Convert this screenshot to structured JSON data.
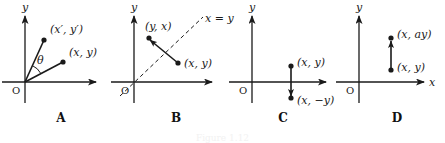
{
  "figure": {
    "width": 445,
    "height": 143,
    "background": "#ffffff",
    "ink_color": "#1a1a1a",
    "caption_cropped": "Figure 1.12"
  },
  "panels": [
    {
      "id": "A",
      "caption": "A",
      "caption_x": 61,
      "caption_y": 112,
      "origin": {
        "x": 25,
        "y": 82
      },
      "origin_label": "O",
      "axes": {
        "y_label": "y",
        "y_label_x": 22,
        "y_label_y": 2,
        "x_label": "",
        "x_axis_left": 2,
        "x_axis_right": 96,
        "y_axis_top": 16,
        "y_axis_bottom": 103
      },
      "points": [
        {
          "label": "(x′, y′)",
          "px": 44,
          "py": 40,
          "label_x": 50,
          "label_y": 24
        },
        {
          "label": "(x, y)",
          "px": 63,
          "py": 62,
          "label_x": 69,
          "label_y": 47
        }
      ],
      "segments": [
        {
          "from": [
            25,
            82
          ],
          "to": [
            44,
            40
          ],
          "style": "solid",
          "arrow": false
        },
        {
          "from": [
            25,
            82
          ],
          "to": [
            63,
            62
          ],
          "style": "solid",
          "arrow": false
        }
      ],
      "angle": {
        "label": "θ",
        "label_x": 37,
        "label_y": 55,
        "radius": 18,
        "start_deg": 28,
        "end_deg": 66
      }
    },
    {
      "id": "B",
      "caption": "B",
      "caption_x": 176,
      "caption_y": 112,
      "origin": {
        "x": 134,
        "y": 82
      },
      "origin_label": "O",
      "axes": {
        "y_label": "y",
        "y_label_x": 131,
        "y_label_y": 2,
        "x_label": "",
        "x_axis_left": 111,
        "x_axis_right": 212,
        "y_axis_top": 16,
        "y_axis_bottom": 103
      },
      "points": [
        {
          "label": "(y, x)",
          "px": 149,
          "py": 38,
          "label_x": 145,
          "label_y": 21
        },
        {
          "label": "(x, y)",
          "px": 178,
          "py": 63,
          "label_x": 184,
          "label_y": 58
        }
      ],
      "segments": [
        {
          "from": [
            178,
            63
          ],
          "to": [
            150,
            40
          ],
          "style": "solid",
          "arrow": true
        }
      ],
      "dashed_line": {
        "from": [
          120,
          96
        ],
        "to": [
          203,
          17
        ],
        "label": "x = y",
        "label_x": 205,
        "label_y": 13
      }
    },
    {
      "id": "C",
      "caption": "C",
      "caption_x": 283,
      "caption_y": 112,
      "origin": {
        "x": 252,
        "y": 82
      },
      "origin_label": "O",
      "axes": {
        "y_label": "y",
        "y_label_x": 249,
        "y_label_y": 2,
        "x_label": "",
        "x_axis_left": 229,
        "x_axis_right": 326,
        "y_axis_top": 16,
        "y_axis_bottom": 103
      },
      "points": [
        {
          "label": "(x, y)",
          "px": 291,
          "py": 66,
          "label_x": 297,
          "label_y": 57
        },
        {
          "label": "(x, −y)",
          "px": 291,
          "py": 98,
          "label_x": 297,
          "label_y": 95
        }
      ],
      "segments": [
        {
          "from": [
            291,
            66
          ],
          "to": [
            291,
            96
          ],
          "style": "solid",
          "arrow": true
        }
      ]
    },
    {
      "id": "D",
      "caption": "D",
      "caption_x": 397,
      "caption_y": 112,
      "origin": {
        "x": 359,
        "y": 82
      },
      "origin_label": "O",
      "axes": {
        "y_label": "y",
        "y_label_x": 356,
        "y_label_y": 2,
        "x_label": "x",
        "x_label_x": 429,
        "x_label_y": 77,
        "x_axis_left": 336,
        "x_axis_right": 424,
        "y_axis_top": 16,
        "y_axis_bottom": 103
      },
      "points": [
        {
          "label": "(x, ay)",
          "px": 391,
          "py": 38,
          "label_x": 397,
          "label_y": 29
        },
        {
          "label": "(x, y)",
          "px": 391,
          "py": 70,
          "label_x": 397,
          "label_y": 62
        }
      ],
      "segments": [
        {
          "from": [
            391,
            70
          ],
          "to": [
            391,
            41
          ],
          "style": "solid",
          "arrow": true
        }
      ]
    }
  ]
}
